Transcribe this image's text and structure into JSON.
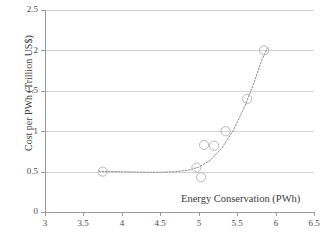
{
  "chart_data": {
    "type": "scatter",
    "title": "",
    "xlabel": "Energy Conservation (PWh)",
    "ylabel": "Cost per PWh (Trillion US$)",
    "xlim": [
      3,
      6.5
    ],
    "ylim": [
      0,
      2.5
    ],
    "xticks": [
      3,
      3.5,
      4,
      4.5,
      5,
      5.5,
      6,
      6.5
    ],
    "xtick_labels": [
      "3",
      "3.5",
      "4",
      "4.5",
      "5",
      "5.5",
      "6",
      "6.5"
    ],
    "yticks": [
      0,
      0.5,
      1,
      1.5,
      2,
      2.5
    ],
    "ytick_labels": [
      "0",
      "0.5",
      "1",
      "1.5",
      "2",
      "2.5"
    ],
    "grid": "horizontal",
    "legend": "none",
    "marker_style": "open-circle",
    "trendline": {
      "style": "dotted",
      "type": "exponential",
      "description": "dotted exponential trendline rising steeply above 5 PWh"
    },
    "points": [
      {
        "x": 3.75,
        "y": 0.5
      },
      {
        "x": 4.97,
        "y": 0.55
      },
      {
        "x": 5.03,
        "y": 0.43
      },
      {
        "x": 5.07,
        "y": 0.83
      },
      {
        "x": 5.2,
        "y": 0.82
      },
      {
        "x": 5.35,
        "y": 1.0
      },
      {
        "x": 5.63,
        "y": 1.4
      },
      {
        "x": 5.85,
        "y": 2.0
      }
    ],
    "trendline_points": [
      {
        "x": 3.7,
        "y": 0.505
      },
      {
        "x": 3.9,
        "y": 0.5
      },
      {
        "x": 4.1,
        "y": 0.496
      },
      {
        "x": 4.3,
        "y": 0.492
      },
      {
        "x": 4.5,
        "y": 0.492
      },
      {
        "x": 4.7,
        "y": 0.5
      },
      {
        "x": 4.85,
        "y": 0.515
      },
      {
        "x": 5.0,
        "y": 0.555
      },
      {
        "x": 5.15,
        "y": 0.64
      },
      {
        "x": 5.3,
        "y": 0.79
      },
      {
        "x": 5.45,
        "y": 1.01
      },
      {
        "x": 5.6,
        "y": 1.31
      },
      {
        "x": 5.72,
        "y": 1.6
      },
      {
        "x": 5.82,
        "y": 1.88
      },
      {
        "x": 5.9,
        "y": 2.04
      }
    ]
  },
  "colors": {
    "marker_stroke": "#b8b8b8",
    "trendline": "#8c8c8c",
    "gridline": "#d4d4d4",
    "axis": "#9a9a9a",
    "text": "#3b3b3b",
    "background": "#ffffff"
  }
}
